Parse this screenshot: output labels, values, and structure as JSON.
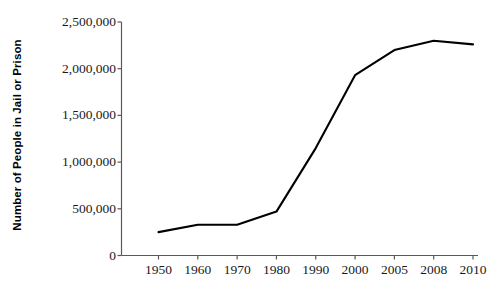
{
  "chart_data": {
    "type": "line",
    "title": "",
    "xlabel": "",
    "ylabel": "Number of People in Jail or Prison",
    "categories": [
      "1950",
      "1960",
      "1970",
      "1980",
      "1990",
      "2000",
      "2005",
      "2008",
      "2010"
    ],
    "values": [
      250000,
      330000,
      330000,
      470000,
      1150000,
      1930000,
      2200000,
      2300000,
      2260000
    ],
    "series": [
      {
        "name": "Number of People in Jail or Prison",
        "values": [
          250000,
          330000,
          330000,
          470000,
          1150000,
          1930000,
          2200000,
          2300000,
          2260000
        ]
      }
    ],
    "ylim": [
      0,
      2500000
    ],
    "yticks": [
      0,
      500000,
      1000000,
      1500000,
      2000000,
      2500000
    ],
    "ytick_labels": [
      "0",
      "500,000",
      "1,000,000",
      "1,500,000",
      "2,000,000",
      "2,500,000"
    ],
    "xtick_labels": [
      "1950",
      "1960",
      "1970",
      "1980",
      "1990",
      "2000",
      "2005",
      "2008",
      "2010"
    ],
    "grid": false,
    "legend": false,
    "legend_position": "none",
    "markers": false,
    "line_color": "#000000",
    "axis_color": "#4d4d4d",
    "background_color": "#ffffff"
  },
  "axes": {
    "y_title": "Number of People in Jail or Prison"
  }
}
